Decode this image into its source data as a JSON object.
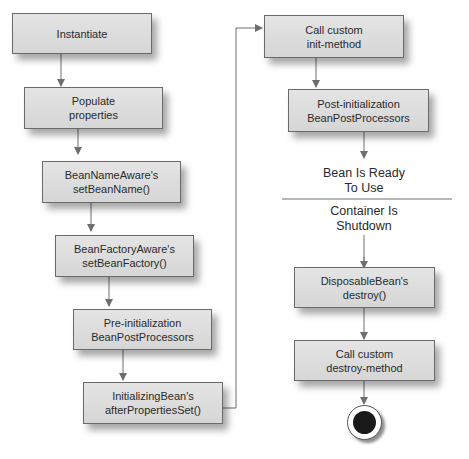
{
  "diagram": {
    "type": "flowchart",
    "left_column": [
      {
        "id": "instantiate",
        "label": "Instantiate"
      },
      {
        "id": "populate",
        "label": "Populate\nproperties"
      },
      {
        "id": "bean-name-aware",
        "label": "BeanNameAware's\nsetBeanName()"
      },
      {
        "id": "bean-factory-aware",
        "label": "BeanFactoryAware's\nsetBeanFactory()"
      },
      {
        "id": "pre-init",
        "label": "Pre-initialization\nBeanPostProcessors"
      },
      {
        "id": "initializing-bean",
        "label": "InitializingBean's\nafterPropertiesSet()"
      }
    ],
    "right_column": [
      {
        "id": "init-method",
        "label": "Call custom\ninit-method"
      },
      {
        "id": "post-init",
        "label": "Post-initialization\nBeanPostProcessors"
      },
      {
        "id": "disposable-bean",
        "label": "DisposableBean's\ndestroy()"
      },
      {
        "id": "destroy-method",
        "label": "Call custom\ndestroy-method"
      }
    ],
    "states": {
      "ready": "Bean Is Ready\nTo Use",
      "shutdown": "Container Is\nShutdown"
    },
    "colors": {
      "box_fill": "#dcdcdc",
      "box_border": "#6a6a6a",
      "arrow": "#6e6e6e",
      "end_node": "#1a1a1a"
    }
  }
}
